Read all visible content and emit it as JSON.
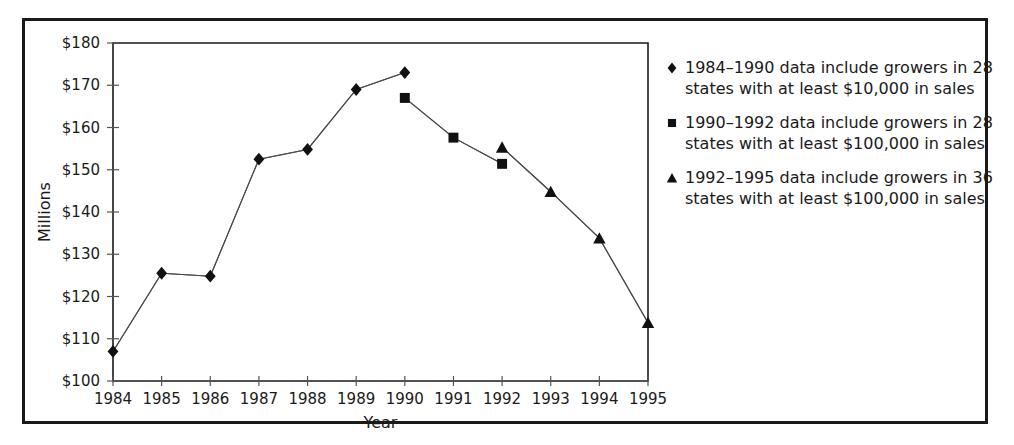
{
  "chart_data": {
    "type": "line",
    "title": "",
    "xlabel": "Year",
    "ylabel": "Millions",
    "x": [
      1984,
      1985,
      1986,
      1987,
      1988,
      1989,
      1990,
      1991,
      1992,
      1993,
      1994,
      1995
    ],
    "xticklabels": [
      "1984",
      "1985",
      "1986",
      "1987",
      "1988",
      "1989",
      "1990",
      "1991",
      "1992",
      "1993",
      "1994",
      "1995"
    ],
    "xlim": [
      1984,
      1995
    ],
    "ylim": [
      100,
      180
    ],
    "yticks": [
      100,
      110,
      120,
      130,
      140,
      150,
      160,
      170,
      180
    ],
    "yticklabels": [
      "$100",
      "$110",
      "$120",
      "$130",
      "$140",
      "$150",
      "$160",
      "$170",
      "$180"
    ],
    "grid": false,
    "legend_position": "right",
    "series": [
      {
        "name": "1984–1990 data include growers in 28 states with at least $10,000 in sales",
        "marker": "diamond",
        "x": [
          1984,
          1985,
          1986,
          1987,
          1988,
          1989,
          1990
        ],
        "values": [
          107.0,
          125.5,
          124.8,
          152.5,
          154.8,
          169.0,
          173.0
        ]
      },
      {
        "name": "1990–1992 data include growers in 28 states with at least $100,000 in sales",
        "marker": "square",
        "x": [
          1990,
          1991,
          1992
        ],
        "values": [
          167.0,
          157.6,
          151.4
        ]
      },
      {
        "name": "1992–1995 data include growers in 36 states with at least $100,000 in sales",
        "marker": "triangle",
        "x": [
          1992,
          1993,
          1994,
          1995
        ],
        "values": [
          155.3,
          144.8,
          133.8,
          113.8
        ]
      }
    ]
  },
  "legend": {
    "entries": [
      {
        "marker": "diamond",
        "line1": "1984–1990 data include growers in 28",
        "line2": "states with at least $10,000 in sales"
      },
      {
        "marker": "square",
        "line1": "1990–1992 data include growers in 28",
        "line2": "states with at least $100,000 in sales"
      },
      {
        "marker": "triangle",
        "line1": "1992–1995 data include growers in 36",
        "line2": "states with at least $100,000 in sales"
      }
    ]
  },
  "axes": {
    "y_title": "Millions",
    "x_title": "Year"
  },
  "colors": {
    "frame": "#1a1a1a",
    "marker": "#111111",
    "line": "#4a4a4a",
    "background": "#ffffff"
  }
}
